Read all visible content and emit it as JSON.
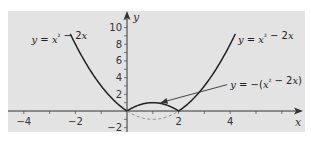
{
  "chart_data": {
    "type": "line",
    "title": "",
    "xlabel": "x",
    "ylabel": "y",
    "xlim": [
      -4.5,
      6.8
    ],
    "ylim": [
      -2.5,
      12
    ],
    "x_ticks": [
      -4,
      -2,
      2,
      4
    ],
    "x_tick_labels": [
      "−4",
      "−2",
      "2",
      "4"
    ],
    "y_ticks": [
      -2,
      2,
      4,
      6,
      8,
      10
    ],
    "y_tick_labels": [
      "−2",
      "2",
      "4",
      "6",
      "8",
      "10"
    ],
    "grid": false,
    "background": "#e3e3e3",
    "series": [
      {
        "name": "y = x² − 2x (left branch)",
        "style": "solid",
        "color": "#222222",
        "function": "x^2 - 2x",
        "domain": [
          -2.2,
          0
        ]
      },
      {
        "name": "y = x² − 2x (right branch)",
        "style": "solid",
        "color": "#222222",
        "function": "x^2 - 2x",
        "domain": [
          2,
          4.2
        ]
      },
      {
        "name": "y = −(x² − 2x)",
        "style": "solid",
        "color": "#222222",
        "function": "-(x^2 - 2x)",
        "domain": [
          0,
          2
        ]
      },
      {
        "name": "y = x² − 2x (reflected part)",
        "style": "dashed",
        "color": "#888888",
        "function": "x^2 - 2x",
        "domain": [
          0,
          2
        ]
      }
    ],
    "annotations": [
      {
        "id": "left",
        "text_parts": [
          "y",
          " = ",
          "x",
          "²",
          " − 2",
          "x"
        ],
        "anchor": [
          -3.7,
          8.2
        ]
      },
      {
        "id": "right",
        "text_parts": [
          "y",
          " = ",
          "x",
          "²",
          " − 2",
          "x"
        ],
        "anchor": [
          4.3,
          8.2
        ]
      },
      {
        "id": "mid",
        "text_parts": [
          "y",
          " = −(",
          "x",
          "²",
          " − 2",
          "x",
          ")"
        ],
        "anchor": [
          4.0,
          2.8
        ],
        "arrow_to": [
          1.3,
          1.0
        ]
      }
    ]
  }
}
